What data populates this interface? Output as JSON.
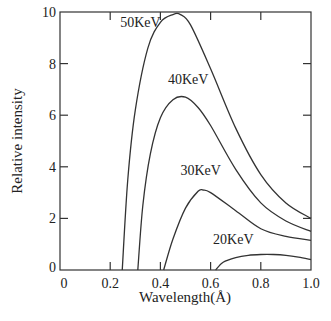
{
  "chart_data": {
    "type": "line",
    "title": "",
    "xlabel": "Wavelength(Å)",
    "ylabel": "Relative intensity",
    "xlim": [
      0,
      1.0
    ],
    "ylim": [
      0,
      10
    ],
    "xticks": [
      "0",
      "0.2",
      "0.4",
      "0.6",
      "0.8",
      "1.0"
    ],
    "yticks": [
      "0",
      "2",
      "4",
      "6",
      "8",
      "10"
    ],
    "grid": false,
    "series": [
      {
        "name": "50KeV",
        "x": [
          0.248,
          0.27,
          0.3,
          0.35,
          0.4,
          0.45,
          0.48,
          0.52,
          0.6,
          0.7,
          0.8,
          0.9,
          1.0
        ],
        "y": [
          0,
          3.5,
          6.2,
          8.6,
          9.6,
          9.9,
          9.9,
          9.5,
          7.8,
          5.5,
          3.7,
          2.6,
          2.0
        ]
      },
      {
        "name": "40KeV",
        "x": [
          0.31,
          0.33,
          0.36,
          0.4,
          0.45,
          0.5,
          0.55,
          0.6,
          0.7,
          0.8,
          0.9,
          1.0
        ],
        "y": [
          0,
          2.5,
          4.5,
          5.9,
          6.6,
          6.7,
          6.3,
          5.6,
          3.9,
          2.6,
          1.9,
          1.5
        ]
      },
      {
        "name": "30KeV",
        "x": [
          0.413,
          0.45,
          0.5,
          0.55,
          0.57,
          0.6,
          0.7,
          0.8,
          0.9,
          1.0
        ],
        "y": [
          0,
          1.2,
          2.4,
          3.05,
          3.1,
          3.0,
          2.3,
          1.6,
          1.3,
          1.15
        ]
      },
      {
        "name": "20KeV",
        "x": [
          0.62,
          0.65,
          0.7,
          0.75,
          0.8,
          0.85,
          0.9,
          0.95,
          1.0
        ],
        "y": [
          0,
          0.3,
          0.48,
          0.57,
          0.6,
          0.6,
          0.57,
          0.5,
          0.4
        ]
      }
    ],
    "annotations": [
      {
        "text": "50KeV",
        "x": 0.24,
        "y": 9.4
      },
      {
        "text": "40KeV",
        "x": 0.43,
        "y": 7.2
      },
      {
        "text": "30KeV",
        "x": 0.48,
        "y": 3.7
      },
      {
        "text": "20KeV",
        "x": 0.61,
        "y": 1.0
      }
    ]
  }
}
